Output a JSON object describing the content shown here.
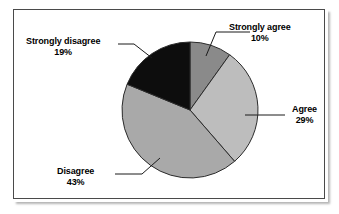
{
  "chart_data": {
    "type": "pie",
    "title": "",
    "categories": [
      "Strongly agree",
      "Agree",
      "Disagree",
      "Strongly disagree"
    ],
    "values": [
      10,
      29,
      43,
      19
    ],
    "unit": "%",
    "legend_position": "none",
    "labels_position": "outside-with-leader-lines",
    "start_angle_deg": 0,
    "direction": "clockwise",
    "slices": [
      {
        "name": "Strongly agree",
        "label": "Strongly agree",
        "percent_text": "10%",
        "value": 10,
        "color": "#8a8a8a"
      },
      {
        "name": "Agree",
        "label": "Agree",
        "percent_text": "29%",
        "value": 29,
        "color": "#bdbdbd"
      },
      {
        "name": "Disagree",
        "label": "Disagree",
        "percent_text": "43%",
        "value": 43,
        "color": "#a9a9a9"
      },
      {
        "name": "Strongly disagree",
        "label": "Strongly disagree",
        "percent_text": "19%",
        "value": 19,
        "color": "#0d0d0d"
      }
    ]
  },
  "chart": {
    "background_color": "#ffffff",
    "frame_color": "#4a4a4a",
    "slice_outline_color": "#2b2b2b",
    "leader_line_color": "#1a1a1a"
  },
  "labels": {
    "strongly_agree": {
      "name": "Strongly agree",
      "percent": "10%"
    },
    "agree": {
      "name": "Agree",
      "percent": "29%"
    },
    "disagree": {
      "name": "Disagree",
      "percent": "43%"
    },
    "strongly_disagree": {
      "name": "Strongly disagree",
      "percent": "19%"
    }
  }
}
